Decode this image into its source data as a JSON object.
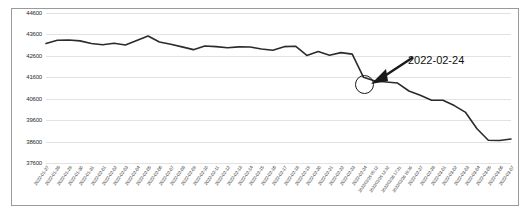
{
  "chart_data": {
    "type": "line",
    "title": "",
    "xlabel": "",
    "ylabel": "",
    "ylim": [
      37600,
      44600
    ],
    "yticks": [
      44600,
      43600,
      42600,
      41600,
      40600,
      39600,
      38600,
      37600
    ],
    "grid": true,
    "legend": null,
    "categories": [
      "2022-01-27",
      "2022-01-28",
      "2022-01-29",
      "2022-01-30",
      "2022-01-31",
      "2022-02-01",
      "2022-02-02",
      "2022-02-03",
      "2022-02-04",
      "2022-02-05",
      "2022-02-06",
      "2022-02-07",
      "2022-02-08",
      "2022-02-09",
      "2022-02-10",
      "2022-02-11",
      "2022-02-12",
      "2022-02-13",
      "2022-02-14",
      "2022-02-15",
      "2022-02-16",
      "2022-02-17",
      "2022-02-18",
      "2022-02-19",
      "2022-02-20",
      "2022-02-21",
      "2022-02-22",
      "2022-02-23",
      "2022-02-24",
      "2022/02/25 00:12",
      "2022/02/25 12:32",
      "2022/02/26 17:21",
      "2022/02/26 19:36",
      "2022-02-27",
      "2022-02-28",
      "2022-03-01",
      "2022-03-02",
      "2022-03-03",
      "2022-03-04",
      "2022-03-05",
      "2022-03-06",
      "2022-03-07"
    ],
    "values": [
      43180,
      43330,
      43340,
      43300,
      43180,
      43120,
      43190,
      43110,
      43320,
      43530,
      43250,
      43140,
      43020,
      42890,
      43060,
      43030,
      42980,
      43020,
      43010,
      42920,
      42860,
      43030,
      43050,
      42620,
      42800,
      42630,
      42750,
      42680,
      41600,
      41430,
      41380,
      41330,
      40960,
      40760,
      40530,
      40530,
      40280,
      39960,
      39200,
      38660,
      38650,
      38720
    ],
    "line_color": "#2b2b2b",
    "annotation": {
      "text": "2022-02-24",
      "target_category": "2022-02-24",
      "target_value": 41600,
      "marker": "circle",
      "arrow": true
    }
  }
}
